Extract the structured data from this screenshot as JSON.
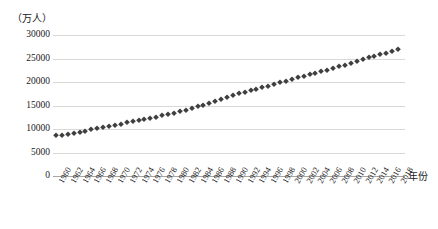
{
  "chart_data": {
    "type": "scatter",
    "title": "",
    "xlabel": "年份",
    "ylabel": "（万人）",
    "ylim": [
      0,
      30000
    ],
    "yticks": [
      30000,
      25000,
      20000,
      15000,
      10000,
      5000,
      0
    ],
    "grid": true,
    "legend": "none",
    "marker": "diamond",
    "marker_color": "#3f3f3f",
    "xtick_labels": [
      "1960",
      "1962",
      "1964",
      "1966",
      "1968",
      "1970",
      "1972",
      "1974",
      "1976",
      "1978",
      "1980",
      "1982",
      "1984",
      "1986",
      "1988",
      "1990",
      "1992",
      "1994",
      "1996",
      "1998",
      "2000",
      "2002",
      "2004",
      "2006",
      "2008",
      "2010",
      "2012",
      "2014",
      "2016",
      "2018"
    ],
    "x": [
      1960,
      1961,
      1962,
      1963,
      1964,
      1965,
      1966,
      1967,
      1968,
      1969,
      1970,
      1971,
      1972,
      1973,
      1974,
      1975,
      1976,
      1977,
      1978,
      1979,
      1980,
      1981,
      1982,
      1983,
      1984,
      1985,
      1986,
      1987,
      1988,
      1989,
      1990,
      1991,
      1992,
      1993,
      1994,
      1995,
      1996,
      1997,
      1998,
      1999,
      2000,
      2001,
      2002,
      2003,
      2004,
      2005,
      2006,
      2007,
      2008,
      2009,
      2010,
      2011,
      2012,
      2013,
      2014,
      2015,
      2016,
      2017,
      2018
    ],
    "values": [
      8700,
      8800,
      8950,
      9150,
      9400,
      9650,
      9900,
      10150,
      10400,
      10650,
      10900,
      11150,
      11400,
      11650,
      11900,
      12150,
      12400,
      12650,
      12900,
      13150,
      13450,
      13750,
      14050,
      14400,
      14800,
      15200,
      15600,
      16000,
      16400,
      16800,
      17200,
      17600,
      17950,
      18250,
      18550,
      18900,
      19250,
      19600,
      19950,
      20300,
      20650,
      21000,
      21300,
      21600,
      21900,
      22250,
      22600,
      22950,
      23300,
      23700,
      24100,
      24500,
      24900,
      25250,
      25600,
      25900,
      26200,
      26600,
      27000
    ]
  }
}
